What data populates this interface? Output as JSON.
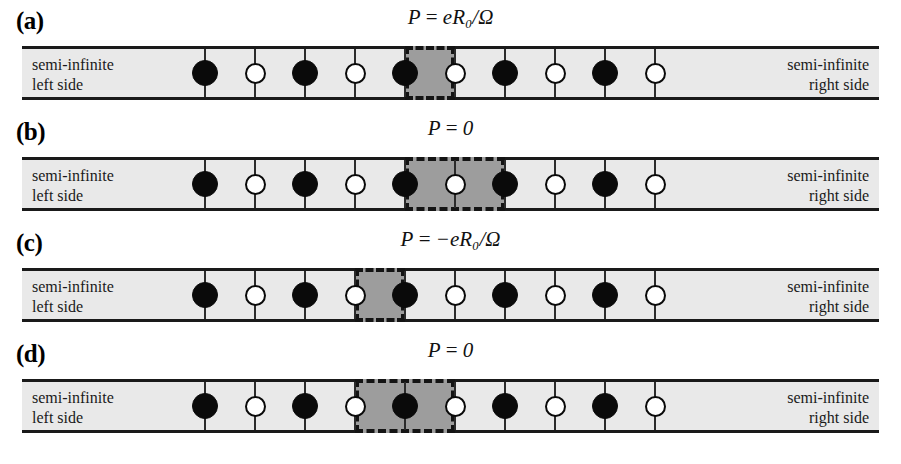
{
  "figure": {
    "band": {
      "left_label": "semi-infinite\nleft side",
      "left_label_line1": "semi-infinite",
      "left_label_line2": "left  side",
      "right_label_line1": "semi-infinite",
      "right_label_line2": "right  side"
    },
    "colors": {
      "band_fill": "#e9e9e9",
      "cell_fill": "#9d9d9d",
      "ink": "#0a0a0a",
      "tick": "#2b2b2b"
    },
    "geometry": {
      "first_site_x": 205,
      "site_spacing": 50,
      "site_count": 10
    },
    "panels": [
      {
        "label": "(a)",
        "equation_html": "P = eR<sub>0</sub>/Ω",
        "equation_text": "P = eR0/Ω",
        "eq_lhs": "P",
        "eq_rel": "=",
        "eq_rhs": "eR₀/Ω",
        "sites": [
          "filled",
          "open",
          "filled",
          "open",
          "filled",
          "open",
          "filled",
          "open",
          "filled",
          "open"
        ],
        "cell_box": {
          "start_site": 5,
          "end_site": 6,
          "contents": [
            "filled",
            "open"
          ]
        }
      },
      {
        "label": "(b)",
        "equation_html": "P = 0",
        "equation_text": "P = 0",
        "eq_lhs": "P",
        "eq_rel": "=",
        "eq_rhs": "0",
        "sites": [
          "filled",
          "open",
          "filled",
          "open",
          "filled",
          "open",
          "filled",
          "open",
          "filled",
          "open"
        ],
        "cell_box": {
          "start_site": 5,
          "end_site": 7,
          "contents": [
            "filled",
            "open",
            "filled"
          ]
        }
      },
      {
        "label": "(c)",
        "equation_html": "P = −eR<sub>0</sub>/Ω",
        "equation_text": "P = −eR0/Ω",
        "eq_lhs": "P",
        "eq_rel": "=",
        "eq_rhs": "−eR₀/Ω",
        "sites": [
          "filled",
          "open",
          "filled",
          "open",
          "filled",
          "open",
          "filled",
          "open",
          "filled",
          "open"
        ],
        "cell_box": {
          "start_site": 4,
          "end_site": 5,
          "contents": [
            "open",
            "filled"
          ]
        }
      },
      {
        "label": "(d)",
        "equation_html": "P = 0",
        "equation_text": "P = 0",
        "eq_lhs": "P",
        "eq_rel": "=",
        "eq_rhs": "0",
        "sites": [
          "filled",
          "open",
          "filled",
          "open",
          "filled",
          "open",
          "filled",
          "open",
          "filled",
          "open"
        ],
        "cell_box": {
          "start_site": 4,
          "end_site": 6,
          "contents": [
            "open",
            "filled",
            "open"
          ]
        }
      }
    ]
  }
}
